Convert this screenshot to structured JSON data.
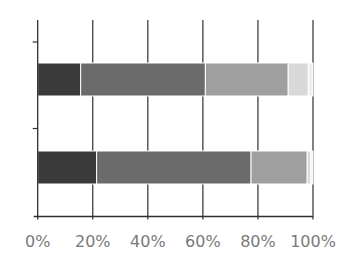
{
  "chart_data": {
    "type": "bar",
    "orientation": "horizontal",
    "stacked": "percent",
    "title": "",
    "xlabel": "",
    "ylabel": "",
    "categories": [
      "Bar 1 (top)",
      "Bar 2 (bottom)"
    ],
    "series": [
      {
        "name": "Segment 1",
        "color": "#3a3a3a",
        "values": [
          15.6,
          21.4
        ]
      },
      {
        "name": "Segment 2",
        "color": "#6b6b6b",
        "values": [
          45.3,
          56.1
        ]
      },
      {
        "name": "Segment 3",
        "color": "#9f9f9f",
        "values": [
          30.1,
          20.4
        ]
      },
      {
        "name": "Segment 4",
        "color": "#d8d8d8",
        "values": [
          7.3,
          1.3
        ]
      },
      {
        "name": "Segment 5",
        "color": "#efefef",
        "values": [
          1.7,
          0.8
        ]
      }
    ],
    "xlim": [
      0,
      100
    ],
    "x_ticks": [
      "0%",
      "20%",
      "40%",
      "60%",
      "80%",
      "100%"
    ],
    "grid": {
      "vertical": true,
      "horizontal": false
    },
    "legend": "none"
  },
  "axis": {
    "tick_labels": [
      "0%",
      "20%",
      "40%",
      "60%",
      "80%",
      "100%"
    ]
  }
}
